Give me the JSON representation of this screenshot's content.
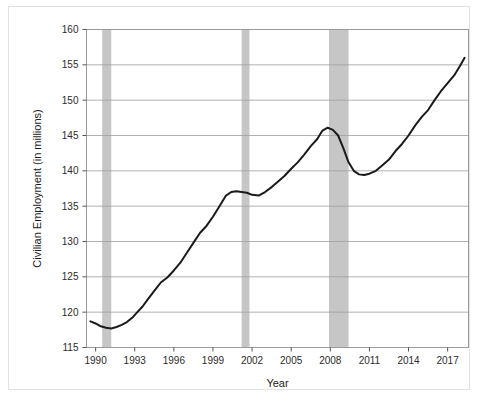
{
  "chart_data": {
    "type": "line",
    "title": "",
    "xlabel": "Year",
    "ylabel": "Civilian Employment (in millions)",
    "xlim": [
      1989.3,
      2018.6
    ],
    "ylim": [
      115,
      160
    ],
    "grid": true,
    "legend": null,
    "line_color": "#1a1a1a",
    "recession_band_color": "#c6c6c6",
    "plot_border_color": "#9a9a9a",
    "gridline_color": "#9e9e9e",
    "xticks": [
      1990,
      1993,
      1996,
      1999,
      2002,
      2005,
      2008,
      2011,
      2014,
      2017
    ],
    "xtick_labels": [
      "1990",
      "1993",
      "1996",
      "1999",
      "2002",
      "2005",
      "2008",
      "2011",
      "2014",
      "2017"
    ],
    "yticks": [
      115,
      120,
      125,
      130,
      135,
      140,
      145,
      150,
      155,
      160
    ],
    "ytick_labels": [
      "115",
      "120",
      "125",
      "130",
      "135",
      "140",
      "145",
      "150",
      "155",
      "160"
    ],
    "series": [
      {
        "name": "Civilian Employment",
        "x": [
          1989.6,
          1990.0,
          1990.4,
          1990.8,
          1991.2,
          1991.6,
          1992.0,
          1992.4,
          1992.8,
          1993.2,
          1993.6,
          1994.0,
          1994.5,
          1995.0,
          1995.5,
          1996.0,
          1996.5,
          1997.0,
          1997.5,
          1998.0,
          1998.5,
          1999.0,
          1999.5,
          2000.0,
          2000.4,
          2000.8,
          2001.2,
          2001.6,
          2002.0,
          2002.5,
          2003.0,
          2003.5,
          2004.0,
          2004.5,
          2005.0,
          2005.5,
          2006.0,
          2006.5,
          2007.0,
          2007.4,
          2007.8,
          2008.2,
          2008.6,
          2009.0,
          2009.4,
          2009.8,
          2010.2,
          2010.6,
          2011.0,
          2011.5,
          2012.0,
          2012.5,
          2013.0,
          2013.5,
          2014.0,
          2014.5,
          2015.0,
          2015.5,
          2016.0,
          2016.5,
          2017.0,
          2017.5,
          2018.0,
          2018.3
        ],
        "y": [
          118.7,
          118.4,
          118.0,
          117.8,
          117.7,
          117.9,
          118.2,
          118.6,
          119.2,
          120.0,
          120.8,
          121.8,
          123.0,
          124.2,
          124.9,
          125.9,
          127.0,
          128.4,
          129.8,
          131.2,
          132.2,
          133.5,
          135.0,
          136.5,
          137.0,
          137.1,
          137.0,
          136.9,
          136.6,
          136.5,
          137.0,
          137.7,
          138.5,
          139.3,
          140.3,
          141.2,
          142.3,
          143.5,
          144.5,
          145.7,
          146.1,
          145.8,
          145.0,
          143.2,
          141.2,
          140.0,
          139.5,
          139.4,
          139.6,
          140.0,
          140.8,
          141.6,
          142.8,
          143.8,
          145.0,
          146.4,
          147.6,
          148.6,
          150.0,
          151.3,
          152.4,
          153.5,
          155.0,
          156.0
        ]
      }
    ],
    "recession_bands": [
      {
        "start": 1990.5,
        "end": 1991.2
      },
      {
        "start": 2001.2,
        "end": 2001.8
      },
      {
        "start": 2007.9,
        "end": 2009.4
      }
    ]
  }
}
